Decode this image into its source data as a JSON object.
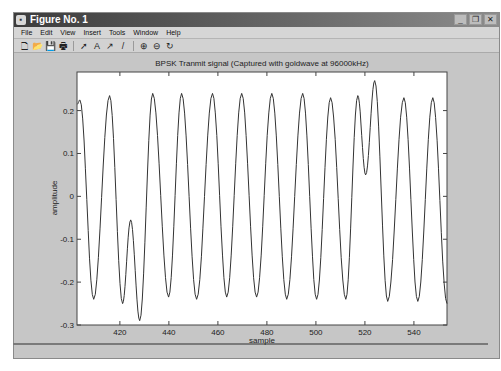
{
  "window": {
    "title": "Figure No. 1",
    "buttons": {
      "minimize": "_",
      "maximize": "❐",
      "close": "✕"
    }
  },
  "menubar": {
    "items": [
      "File",
      "Edit",
      "View",
      "Insert",
      "Tools",
      "Window",
      "Help"
    ]
  },
  "toolbar": {
    "icons": [
      "new-file-icon",
      "open-file-icon",
      "save-icon",
      "print-icon",
      "select-arrow-icon",
      "text-icon",
      "arrow-icon",
      "line-icon",
      "zoom-in-icon",
      "zoom-out-icon",
      "rotate-icon"
    ],
    "glyphs": [
      "🗋",
      "📂",
      "💾",
      "🖶",
      "➚",
      "A",
      "↗",
      "/",
      "⊕",
      "⊖",
      "↻"
    ]
  },
  "chart_data": {
    "type": "line",
    "title": "BPSK Tranmit signal (Captured with goldwave at 96000kHz)",
    "xlabel": "sample",
    "ylabel": "amplitude",
    "xlim": [
      402.5,
      553.5
    ],
    "ylim": [
      -0.3,
      0.29
    ],
    "xticks": [
      420,
      440,
      460,
      480,
      500,
      520,
      540
    ],
    "yticks": [
      0.2,
      0.1,
      0,
      -0.1,
      -0.2,
      -0.3
    ],
    "ytick_labels": [
      "0.2",
      "0.1",
      "0",
      "-0.1",
      "-0.2",
      "-0.3"
    ],
    "grid": false,
    "line_color": "#333333",
    "extrema": [
      [
        402.6,
        0.215
      ],
      [
        403.7,
        0.225
      ],
      [
        409.3,
        -0.24
      ],
      [
        415.8,
        0.235
      ],
      [
        421.1,
        -0.25
      ],
      [
        424.4,
        -0.055
      ],
      [
        428.1,
        -0.29
      ],
      [
        433.4,
        0.24
      ],
      [
        439.9,
        -0.235
      ],
      [
        445.2,
        0.24
      ],
      [
        451.3,
        -0.24
      ],
      [
        457.8,
        0.24
      ],
      [
        463.6,
        -0.235
      ],
      [
        469.7,
        0.24
      ],
      [
        475.8,
        -0.235
      ],
      [
        482.0,
        0.24
      ],
      [
        488.1,
        -0.24
      ],
      [
        494.6,
        0.24
      ],
      [
        500.3,
        -0.24
      ],
      [
        506.0,
        0.23
      ],
      [
        512.2,
        -0.24
      ],
      [
        517.1,
        0.235
      ],
      [
        520.3,
        0.05
      ],
      [
        524.0,
        0.27
      ],
      [
        529.3,
        -0.245
      ],
      [
        535.9,
        0.23
      ],
      [
        541.6,
        -0.245
      ],
      [
        547.7,
        0.23
      ],
      [
        553.5,
        -0.25
      ]
    ]
  }
}
